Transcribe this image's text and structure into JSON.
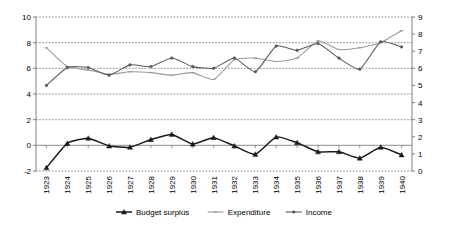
{
  "chart_data": {
    "type": "line",
    "title": "",
    "xlabel": "",
    "ylabel": "",
    "grid": true,
    "legend_position": "bottom",
    "categories": [
      "1923",
      "1924",
      "1925",
      "1926",
      "1927",
      "1928",
      "1929",
      "1930",
      "1931",
      "1932",
      "1933",
      "1934",
      "1935",
      "1936",
      "1937",
      "1938",
      "1939",
      "1940"
    ],
    "axes": {
      "left": {
        "label": "",
        "min": -2,
        "max": 10,
        "step": 2,
        "ticks": [
          "10",
          "8",
          "6",
          "4",
          "2",
          "0",
          "-2"
        ],
        "series": [
          "Budget surplus"
        ]
      },
      "right": {
        "label": "",
        "min": 0,
        "max": 9,
        "step": 1,
        "ticks": [
          "9",
          "8",
          "7",
          "6",
          "5",
          "4",
          "3",
          "2",
          "1",
          "0"
        ],
        "series": [
          "Expenditure",
          "Income"
        ]
      }
    },
    "series": [
      {
        "name": "Budget surplus",
        "axis": "left",
        "color": "#1a1a1a",
        "marker": "triangle",
        "values": [
          -1.75,
          0.15,
          0.55,
          -0.05,
          -0.15,
          0.45,
          0.85,
          0.1,
          0.6,
          -0.05,
          -0.7,
          0.65,
          0.2,
          -0.5,
          -0.5,
          -1.0,
          -0.15,
          -0.75
        ]
      },
      {
        "name": "Expenditure",
        "axis": "right",
        "color": "#9a9a9a",
        "marker": "dash",
        "values": [
          7.2,
          6.1,
          5.9,
          5.65,
          5.8,
          5.75,
          5.6,
          5.75,
          5.35,
          6.5,
          6.6,
          6.4,
          6.6,
          7.6,
          7.1,
          7.2,
          7.5,
          8.2
        ]
      },
      {
        "name": "Income",
        "axis": "right",
        "color": "#5a5a5a",
        "marker": "dot",
        "values": [
          5.0,
          6.05,
          6.05,
          5.6,
          6.2,
          6.1,
          6.6,
          6.1,
          6.0,
          6.6,
          5.8,
          7.3,
          7.05,
          7.45,
          6.6,
          5.95,
          7.55,
          7.25
        ]
      }
    ],
    "legend": [
      {
        "label": "Budget surplus",
        "color": "#1a1a1a",
        "marker": "triangle"
      },
      {
        "label": "Expenditure",
        "color": "#9a9a9a",
        "marker": "dash"
      },
      {
        "label": "Income",
        "color": "#5a5a5a",
        "marker": "dot"
      }
    ]
  },
  "colors": {
    "axis": "#808080",
    "grid": "#555555",
    "background": "#ffffff",
    "budget_surplus": "#1a1a1a",
    "expenditure": "#9a9a9a",
    "income": "#5a5a5a"
  }
}
